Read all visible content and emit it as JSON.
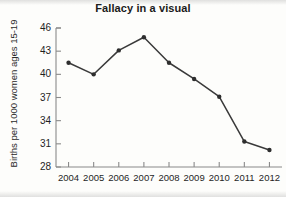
{
  "chart_data": {
    "type": "line",
    "title": "Fallacy in a visual",
    "xlabel": "",
    "ylabel": "Births per 1000 women ages 15-19",
    "categories": [
      "2004",
      "2005",
      "2006",
      "2007",
      "2008",
      "2009",
      "2010",
      "2011",
      "2012"
    ],
    "x": [
      2004,
      2005,
      2006,
      2007,
      2008,
      2009,
      2010,
      2011,
      2012
    ],
    "values": [
      41.5,
      40.0,
      43.1,
      44.8,
      41.5,
      39.4,
      37.1,
      31.3,
      30.2
    ],
    "series": [
      {
        "name": "Births per 1000 women ages 15-19",
        "values": [
          41.5,
          40.0,
          43.1,
          44.8,
          41.5,
          39.4,
          37.1,
          31.3,
          30.2
        ]
      }
    ],
    "ylim": [
      28,
      46
    ],
    "yticks": [
      28,
      31,
      34,
      37,
      40,
      43,
      46
    ],
    "ytick_labels": [
      "28",
      "31",
      "34",
      "37",
      "40",
      "43",
      "46"
    ],
    "xlim": [
      2003.5,
      2012.5
    ],
    "grid": false,
    "legend": false,
    "legend_position": "none",
    "line_color": "#3a3a3a",
    "marker": "circle",
    "marker_color": "#2e2e2e",
    "axis_color": "#8a8a8a",
    "background_color": "#fdfdfb"
  }
}
